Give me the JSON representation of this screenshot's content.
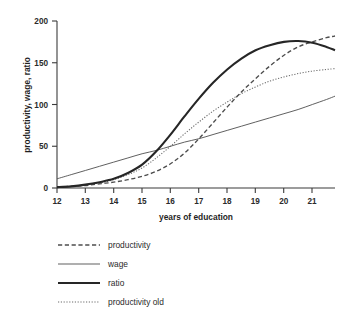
{
  "chart_data": {
    "type": "line",
    "title": "",
    "xlabel": "years of education",
    "ylabel": "productivity, wage, ratio",
    "xlim": [
      12,
      21.8
    ],
    "ylim": [
      0,
      200
    ],
    "xticks": [
      12,
      13,
      14,
      15,
      16,
      17,
      18,
      19,
      20,
      21
    ],
    "yticks": [
      0,
      50,
      100,
      150,
      200
    ],
    "xtick_labels": [
      "12",
      "13",
      "14",
      "15",
      "16",
      "17",
      "18",
      "19",
      "20",
      "21"
    ],
    "ytick_labels": [
      "0",
      "50",
      "100",
      "150",
      "200"
    ],
    "grid": false,
    "legend_position": "below",
    "x": [
      12,
      12.5,
      13,
      13.5,
      14,
      14.5,
      15,
      15.5,
      16,
      16.5,
      17,
      17.5,
      18,
      18.5,
      19,
      19.5,
      20,
      20.5,
      21,
      21.5,
      21.8
    ],
    "series": [
      {
        "name": "productivity",
        "style": "dashed",
        "values": [
          1,
          2,
          3,
          5,
          7,
          10,
          14,
          20,
          29,
          42,
          59,
          78,
          97,
          115,
          131,
          146,
          159,
          169,
          175,
          180,
          182
        ]
      },
      {
        "name": "wage",
        "style": "solid-thin",
        "values": [
          11,
          16,
          21,
          26,
          31,
          36,
          41,
          45,
          50,
          55,
          59,
          64,
          69,
          74,
          79,
          84,
          89,
          94,
          100,
          106,
          110
        ]
      },
      {
        "name": "ratio",
        "style": "solid-thick",
        "values": [
          1,
          2,
          4,
          7,
          11,
          18,
          28,
          44,
          64,
          86,
          107,
          126,
          142,
          155,
          165,
          171,
          175,
          176,
          174,
          169,
          165
        ]
      },
      {
        "name": "productivity old",
        "style": "dotted",
        "values": [
          1,
          2,
          4,
          6,
          10,
          16,
          24,
          36,
          50,
          65,
          79,
          92,
          103,
          113,
          121,
          128,
          133,
          137,
          140,
          142,
          143
        ]
      }
    ]
  },
  "legend": {
    "items": [
      {
        "label": "productivity"
      },
      {
        "label": "wage"
      },
      {
        "label": "ratio"
      },
      {
        "label": "productivity old"
      }
    ]
  },
  "colors": {
    "axis": "#3b3b3b",
    "productivity": "#4d4d4d",
    "wage": "#575757",
    "ratio": "#262626",
    "productivity_old": "#6b6b6b",
    "background": "#ffffff"
  }
}
